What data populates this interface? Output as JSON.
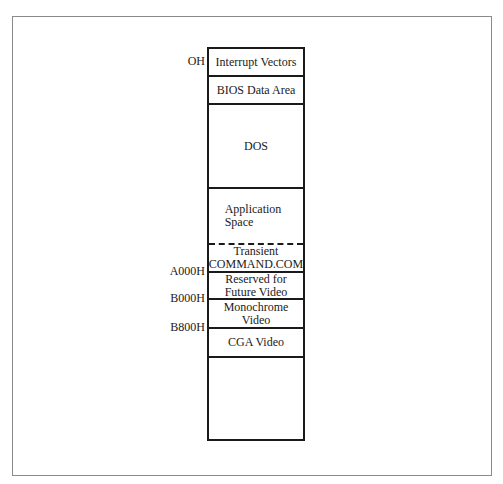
{
  "diagram": {
    "type": "memory-map",
    "segments": [
      {
        "label": "Interrupt Vectors",
        "top": 0,
        "height": 28,
        "border": "solid"
      },
      {
        "label": "BIOS Data Area",
        "top": 28,
        "height": 28,
        "border": "solid"
      },
      {
        "label": "DOS",
        "top": 56,
        "height": 84,
        "border": "solid"
      },
      {
        "label": "Application\nSpace",
        "top": 140,
        "height": 56,
        "border": "dashed"
      },
      {
        "label": "Transient\nCOMMAND.COM",
        "top": 196,
        "height": 28,
        "border": "solid"
      },
      {
        "label": "Reserved for\nFuture Video",
        "top": 224,
        "height": 27,
        "border": "solid"
      },
      {
        "label": "Monochrome\nVideo",
        "top": 251,
        "height": 29,
        "border": "solid"
      },
      {
        "label": "CGA Video",
        "top": 280,
        "height": 29,
        "border": "solid"
      },
      {
        "label": "",
        "top": 309,
        "height": 81,
        "border": "none"
      }
    ],
    "addresses": [
      {
        "label": "OH",
        "y": 55
      },
      {
        "label": "A000H",
        "y": 265
      },
      {
        "label": "B000H",
        "y": 292
      },
      {
        "label": "B800H",
        "y": 321
      }
    ]
  }
}
